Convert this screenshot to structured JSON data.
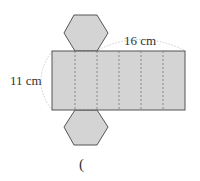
{
  "figure": {
    "type": "hexagonal-prism-net",
    "colors": {
      "fill": "#d4d4d4",
      "stroke": "#555555",
      "dash": "#777777",
      "arc": "#cccccc",
      "text": "#333333"
    },
    "labels": {
      "width": "16 cm",
      "height": "11 cm",
      "answer_paren": "("
    },
    "lateral_faces": 6,
    "bases": 2
  }
}
